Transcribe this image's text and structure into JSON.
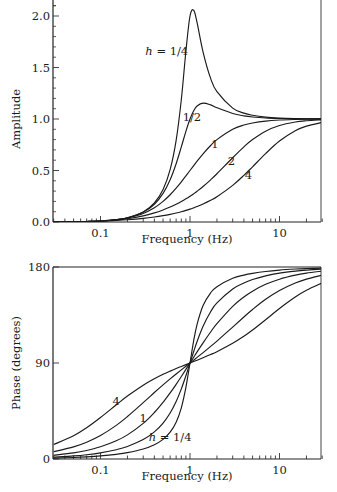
{
  "chart_data": [
    {
      "type": "line",
      "title": "",
      "xlabel": "Frequency (Hz)",
      "ylabel": "Amplitude",
      "xscale": "log",
      "xlim": [
        0.03,
        30
      ],
      "ylim": [
        0,
        2.15
      ],
      "xticks": [
        {
          "value": 0.1,
          "label": "0.1"
        },
        {
          "value": 1,
          "label": "1"
        },
        {
          "value": 10,
          "label": "10"
        }
      ],
      "yticks": [
        {
          "value": 0.0,
          "label": "0.0"
        },
        {
          "value": 0.5,
          "label": "0.5"
        },
        {
          "value": 1.0,
          "label": "1.0"
        },
        {
          "value": 1.5,
          "label": "1.5"
        },
        {
          "value": 2.0,
          "label": "2.0"
        }
      ],
      "grid": false,
      "legend": "none (inline curve labels)",
      "x": [
        0.03,
        0.05,
        0.07,
        0.1,
        0.15,
        0.2,
        0.3,
        0.4,
        0.5,
        0.6,
        0.7,
        0.8,
        0.9,
        1.0,
        1.1,
        1.2,
        1.4,
        1.7,
        2,
        3,
        4,
        5,
        7,
        10,
        15,
        20,
        30
      ],
      "series": [
        {
          "name": "h = 1/4",
          "label": "h = 1/4",
          "values": [
            0.0009,
            0.0025,
            0.0049,
            0.0101,
            0.023,
            0.0414,
            0.0976,
            0.1853,
            0.3162,
            0.5093,
            0.792,
            1.189,
            1.658,
            2.0,
            2.056,
            1.935,
            1.65,
            1.394,
            1.265,
            1.106,
            1.057,
            1.036,
            1.018,
            1.009,
            1.004,
            1.002,
            1.001
          ]
        },
        {
          "name": "h = 1/2",
          "label": "1/2",
          "values": [
            0.0009,
            0.0025,
            0.0049,
            0.01,
            0.0228,
            0.0408,
            0.0939,
            0.1719,
            0.2774,
            0.4103,
            0.5658,
            0.7294,
            0.8806,
            1.0,
            1.0805,
            1.1266,
            1.1547,
            1.137,
            1.1094,
            1.0534,
            1.0307,
            1.0198,
            1.0101,
            1.005,
            1.0022,
            1.0012,
            1.0006
          ]
        },
        {
          "name": "h = 1",
          "label": "1",
          "values": [
            0.0009,
            0.0025,
            0.0049,
            0.0099,
            0.022,
            0.0385,
            0.0826,
            0.1379,
            0.2,
            0.2647,
            0.3289,
            0.3902,
            0.4475,
            0.5,
            0.5475,
            0.5902,
            0.6622,
            0.7429,
            0.8,
            0.9,
            0.9412,
            0.9615,
            0.98,
            0.9901,
            0.9956,
            0.9975,
            0.9989
          ]
        },
        {
          "name": "h = 2",
          "label": "2",
          "values": [
            0.0009,
            0.0025,
            0.0047,
            0.0094,
            0.0196,
            0.032,
            0.0598,
            0.0885,
            0.117,
            0.1449,
            0.1722,
            0.1987,
            0.2247,
            0.25,
            0.2747,
            0.2988,
            0.345,
            0.4095,
            0.4682,
            0.624,
            0.7295,
            0.8002,
            0.8818,
            0.9366,
            0.9704,
            0.983,
            0.9925
          ]
        },
        {
          "name": "h = 4",
          "label": "4",
          "values": [
            0.0009,
            0.0023,
            0.0043,
            0.0079,
            0.0145,
            0.0214,
            0.0351,
            0.0484,
            0.0614,
            0.0743,
            0.0871,
            0.0998,
            0.1125,
            0.125,
            0.1375,
            0.1499,
            0.1744,
            0.2105,
            0.2457,
            0.3558,
            0.4527,
            0.536,
            0.6643,
            0.7857,
            0.8855,
            0.9305,
            0.9672
          ]
        }
      ],
      "annotations": [
        {
          "text": "h = 1/4",
          "italic_prefix": "h",
          "x": 0.55,
          "y": 1.62
        },
        {
          "text": "1/2",
          "x": 1.05,
          "y": 0.98
        },
        {
          "text": "1",
          "x": 1.9,
          "y": 0.72
        },
        {
          "text": "2",
          "x": 2.9,
          "y": 0.55
        },
        {
          "text": "4",
          "x": 4.5,
          "y": 0.42
        }
      ]
    },
    {
      "type": "line",
      "title": "",
      "xlabel": "Frequency (Hz)",
      "ylabel": "Phase (degrees)",
      "xscale": "log",
      "xlim": [
        0.03,
        30
      ],
      "ylim": [
        0,
        180
      ],
      "xticks": [
        {
          "value": 0.1,
          "label": "0.1"
        },
        {
          "value": 1,
          "label": "1"
        },
        {
          "value": 10,
          "label": "10"
        }
      ],
      "yticks": [
        {
          "value": 0,
          "label": "0"
        },
        {
          "value": 90,
          "label": "90"
        },
        {
          "value": 180,
          "label": "180"
        }
      ],
      "grid": false,
      "legend": "none (inline curve labels)",
      "x": [
        0.03,
        0.05,
        0.07,
        0.1,
        0.15,
        0.2,
        0.3,
        0.4,
        0.5,
        0.6,
        0.7,
        0.8,
        0.9,
        1.0,
        1.1,
        1.2,
        1.4,
        1.7,
        2,
        3,
        4,
        5,
        7,
        10,
        15,
        20,
        30
      ],
      "series": [
        {
          "name": "h = 1/4",
          "label": "h = 1/4",
          "values": [
            0.86,
            1.44,
            2.01,
            2.89,
            4.39,
            5.95,
            9.36,
            13.39,
            18.43,
            25.11,
            34.46,
            48.01,
            67.11,
            90,
            110.9,
            126.3,
            143.9,
            155.8,
            161.57,
            169.38,
            172.41,
            174.05,
            175.83,
            177.11,
            178.08,
            178.56,
            179.04
          ]
        },
        {
          "name": "h = 1/2",
          "label": "",
          "values": [
            1.72,
            2.87,
            4.02,
            5.77,
            8.72,
            11.77,
            18.25,
            25.46,
            33.69,
            43.15,
            53.93,
            65.77,
            78.08,
            90,
            100.81,
            110.14,
            124.44,
            138.03,
            146.31,
            159.44,
            165.07,
            168.23,
            171.7,
            174.23,
            176.17,
            177.13,
            178.09
          ]
        },
        {
          "name": "h = 1",
          "label": "1",
          "values": [
            3.44,
            5.72,
            8.01,
            11.42,
            17.06,
            22.62,
            33.4,
            43.6,
            53.13,
            61.93,
            70.0,
            77.32,
            83.97,
            90,
            95.45,
            100.39,
            108.92,
            119.07,
            126.87,
            143.13,
            151.93,
            157.38,
            163.74,
            168.58,
            172.37,
            174.28,
            176.18
          ]
        },
        {
          "name": "h = 2",
          "label": "",
          "values": [
            6.85,
            11.34,
            15.72,
            22.0,
            31.54,
            39.81,
            52.83,
            62.3,
            69.44,
            75.07,
            79.68,
            83.58,
            86.98,
            90,
            92.73,
            95.24,
            99.73,
            105.53,
            110.56,
            123.69,
            133.15,
            140.19,
            149.74,
            158.0,
            165.0,
            168.66,
            172.4
          ]
        },
        {
          "name": "h = 4",
          "label": "4",
          "values": [
            13.51,
            21.85,
            29.37,
            38.94,
            50.83,
            59.04,
            69.23,
            75.29,
            79.38,
            82.41,
            84.8,
            86.78,
            88.49,
            90,
            91.37,
            92.62,
            94.9,
            97.91,
            100.62,
            108.43,
            115.11,
            120.96,
            130.6,
            141.06,
            151.82,
            158.15,
            165.05
          ]
        }
      ],
      "annotations": [
        {
          "text": "4",
          "x": 0.15,
          "y": 51
        },
        {
          "text": "1",
          "x": 0.3,
          "y": 35
        },
        {
          "text": "h = 1/4",
          "italic_prefix": "h",
          "x": 0.6,
          "y": 17
        }
      ]
    }
  ]
}
